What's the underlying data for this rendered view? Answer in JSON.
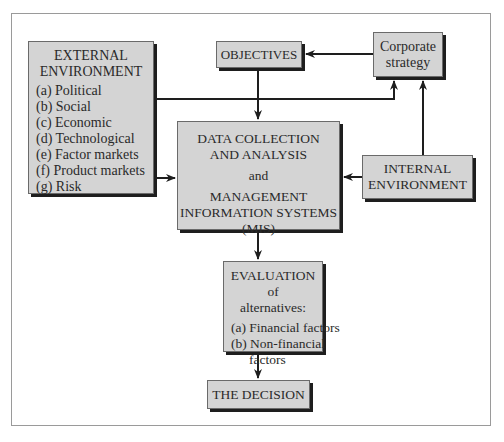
{
  "diagram": {
    "external_environment": {
      "title_lines": [
        "EXTERNAL",
        "ENVIRONMENT"
      ],
      "items": [
        "(a) Political",
        "(b) Social",
        "(c) Economic",
        "(d) Technological",
        "(e) Factor markets",
        "(f) Product markets",
        "(g) Risk"
      ]
    },
    "objectives": {
      "label": "OBJECTIVES"
    },
    "corporate_strategy": {
      "lines": [
        "Corporate",
        "strategy"
      ]
    },
    "data_collection": {
      "lines": [
        "DATA COLLECTION",
        "AND ANALYSIS",
        "and",
        "MANAGEMENT",
        "INFORMATION SYSTEMS",
        "(MIS)"
      ]
    },
    "internal_environment": {
      "lines": [
        "INTERNAL",
        "ENVIRONMENT"
      ]
    },
    "evaluation": {
      "title_lines": [
        "EVALUATION of",
        "alternatives:"
      ],
      "items": [
        "(a) Financial factors",
        "(b) Non-financial",
        "factors"
      ]
    },
    "decision": {
      "label": "THE DECISION"
    },
    "colors": {
      "box_fill": "#d4d4d4",
      "shadow": "#1e1e1e",
      "line": "#1e1e1e",
      "frame": "#9a9a9a"
    }
  }
}
